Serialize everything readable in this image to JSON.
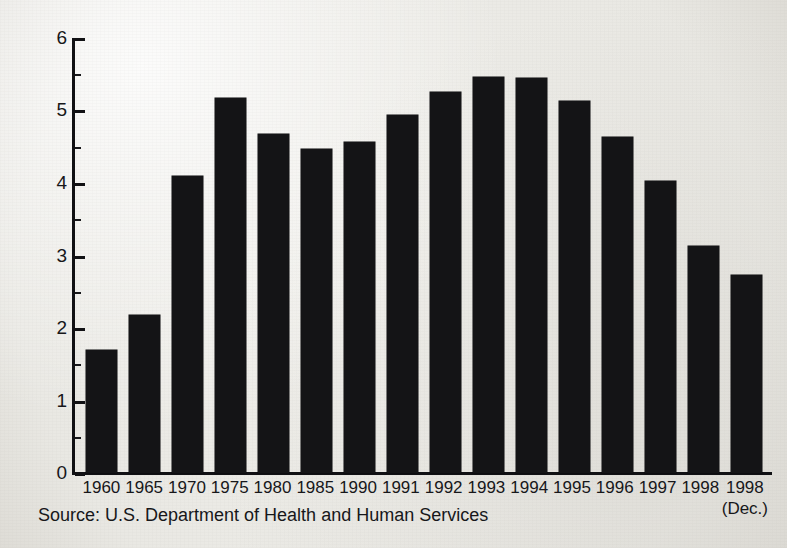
{
  "chart_data": {
    "type": "bar",
    "title": "",
    "subtitle": "",
    "xlabel": "",
    "ylabel": "Average Monthly Percentage",
    "ylim": [
      0,
      6
    ],
    "ytick_labels": [
      "6",
      "5",
      "4",
      "3",
      "2",
      "1",
      "0"
    ],
    "ytick_values": [
      6,
      5,
      4,
      3,
      2,
      1,
      0
    ],
    "minor_ticks": [
      5.5,
      4.5,
      3.5,
      2.5,
      1.5,
      0.5
    ],
    "grid": false,
    "legend": null,
    "bar_color": "#141416",
    "axis_color": "#111114",
    "background_color": "#efeeea",
    "categories": [
      "1960",
      "1965",
      "1970",
      "1975",
      "1980",
      "1985",
      "1990",
      "1991",
      "1992",
      "1993",
      "1994",
      "1995",
      "1996",
      "1997",
      "1998",
      "1998"
    ],
    "category_sublabels": [
      "",
      "",
      "",
      "",
      "",
      "",
      "",
      "",
      "",
      "",
      "",
      "",
      "",
      "",
      "",
      "(Dec.)"
    ],
    "values": [
      1.7,
      2.18,
      4.1,
      5.17,
      4.68,
      4.47,
      4.56,
      4.94,
      5.26,
      5.46,
      5.45,
      5.13,
      4.63,
      4.03,
      3.13,
      2.73
    ],
    "source_note": "Source: U.S. Department of Health and Human Services"
  }
}
